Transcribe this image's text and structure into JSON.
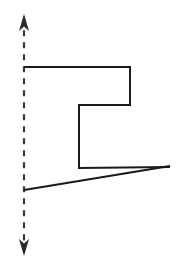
{
  "figure": {
    "canvas": {
      "width": 176,
      "height": 277,
      "background": "#ffffff"
    },
    "colors": {
      "stroke": "#1a1a1a",
      "axis": "#3a3a3a",
      "background": "#ffffff"
    },
    "axis": {
      "name": "vertical-dashed-axis",
      "orientation": "vertical",
      "x": 24,
      "y_top": 14,
      "y_bottom": 256,
      "dash_length": 6,
      "dash_gap": 6,
      "stroke_width": 2.2,
      "arrow_top": {
        "tip_x": 24,
        "tip_y": 14,
        "half_width": 5,
        "length": 17
      },
      "arrow_bottom": {
        "tip_x": 24,
        "tip_y": 256,
        "half_width": 5,
        "length": 17
      }
    },
    "polyline": {
      "name": "stepped-polyline",
      "stroke_width": 2,
      "points": [
        {
          "x": 24,
          "y": 67
        },
        {
          "x": 130,
          "y": 67
        },
        {
          "x": 130,
          "y": 105
        },
        {
          "x": 79,
          "y": 105
        },
        {
          "x": 79,
          "y": 168
        },
        {
          "x": 170,
          "y": 167
        }
      ],
      "segments": [
        {
          "id": "top-horizontal",
          "from": [
            24,
            67
          ],
          "to": [
            130,
            67
          ]
        },
        {
          "id": "upper-right-vertical",
          "from": [
            130,
            67
          ],
          "to": [
            130,
            105
          ]
        },
        {
          "id": "middle-horizontal",
          "from": [
            130,
            105
          ],
          "to": [
            79,
            105
          ]
        },
        {
          "id": "middle-vertical",
          "from": [
            79,
            105
          ],
          "to": [
            79,
            168
          ]
        },
        {
          "id": "lower-horizontal",
          "from": [
            79,
            168
          ],
          "to": [
            170,
            167
          ]
        }
      ]
    },
    "chord": {
      "name": "slanted-chord",
      "stroke_width": 2,
      "from": [
        24,
        190
      ],
      "to": [
        170,
        166
      ]
    }
  }
}
